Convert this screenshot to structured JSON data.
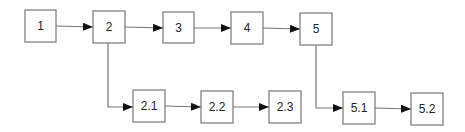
{
  "diagram": {
    "type": "flowchart",
    "colors": {
      "stroke": "#777777",
      "arrow": "#111111",
      "text": "#222222",
      "background": "#ffffff"
    },
    "nodes": [
      {
        "id": "1",
        "label": "1",
        "x": 25,
        "y": 10,
        "w": 31,
        "h": 32
      },
      {
        "id": "2",
        "label": "2",
        "x": 93,
        "y": 11,
        "w": 32,
        "h": 32
      },
      {
        "id": "3",
        "label": "3",
        "x": 163,
        "y": 12,
        "w": 31,
        "h": 31
      },
      {
        "id": "4",
        "label": "4",
        "x": 231,
        "y": 12,
        "w": 32,
        "h": 32
      },
      {
        "id": "5",
        "label": "5",
        "x": 300,
        "y": 13,
        "w": 32,
        "h": 32
      },
      {
        "id": "2.1",
        "label": "2.1",
        "x": 133,
        "y": 90,
        "w": 32,
        "h": 32
      },
      {
        "id": "2.2",
        "label": "2.2",
        "x": 201,
        "y": 91,
        "w": 32,
        "h": 32
      },
      {
        "id": "2.3",
        "label": "2.3",
        "x": 269,
        "y": 91,
        "w": 32,
        "h": 32
      },
      {
        "id": "5.1",
        "label": "5.1",
        "x": 343,
        "y": 92,
        "w": 32,
        "h": 32
      },
      {
        "id": "5.2",
        "label": "5.2",
        "x": 411,
        "y": 93,
        "w": 32,
        "h": 32
      }
    ],
    "edges": [
      {
        "from": "1",
        "to": "2"
      },
      {
        "from": "2",
        "to": "3"
      },
      {
        "from": "3",
        "to": "4"
      },
      {
        "from": "4",
        "to": "5"
      },
      {
        "from": "2",
        "to": "2.1",
        "route": "down-then-right"
      },
      {
        "from": "2.1",
        "to": "2.2"
      },
      {
        "from": "2.2",
        "to": "2.3"
      },
      {
        "from": "5",
        "to": "5.1",
        "route": "down-then-right"
      },
      {
        "from": "5.1",
        "to": "5.2"
      }
    ]
  }
}
